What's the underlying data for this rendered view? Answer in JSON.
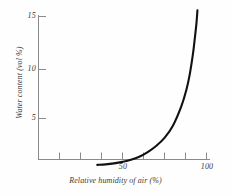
{
  "chart_data": {
    "type": "line",
    "title": "",
    "xlabel": "Relative  humidity of air (%)",
    "ylabel": "Water content (vol %)",
    "xlim": [
      20,
      100
    ],
    "ylim": [
      0,
      16
    ],
    "grid": false,
    "legend": null,
    "x_ticks": [
      20,
      30,
      40,
      50,
      60,
      70,
      80,
      90,
      100
    ],
    "x_tick_labels": [
      "",
      "",
      "",
      "50",
      "",
      "",
      "",
      "",
      "100"
    ],
    "y_ticks": [
      5,
      10,
      15
    ],
    "y_tick_labels": [
      "5",
      "10",
      "15"
    ],
    "series": [
      {
        "name": "sorption isotherm",
        "x": [
          35,
          40,
          45,
          50,
          55,
          60,
          65,
          70,
          75,
          80,
          85,
          88,
          90,
          92,
          93,
          94,
          94.6
        ],
        "y": [
          0.45,
          0.5,
          0.6,
          0.75,
          0.95,
          1.25,
          1.7,
          2.3,
          3.1,
          4.3,
          6.2,
          7.8,
          9.3,
          11.4,
          12.8,
          14.3,
          15.6
        ]
      }
    ]
  },
  "axes": {
    "y_labels": [
      {
        "value": "15"
      },
      {
        "value": "10"
      },
      {
        "value": "5"
      }
    ],
    "x_labels": [
      {
        "value": "50"
      },
      {
        "value": "100"
      }
    ],
    "x_title": "Relative  humidity of air (%)",
    "y_title": "Water content (vol %)"
  }
}
